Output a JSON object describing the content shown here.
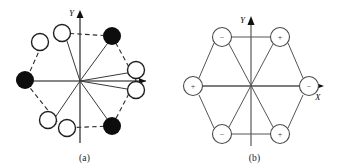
{
  "figure": {
    "panels": [
      {
        "id": "a",
        "caption": "(a)",
        "axis": {
          "x_label": "X",
          "y_label": "Y"
        },
        "description": "hexagonal arrangement with filled and open circles, dashed hexagon outline and solid star diagonals",
        "nodes": [
          {
            "name": "node-top-right",
            "fill": "filled",
            "x": 112,
            "y": 36
          },
          {
            "name": "node-right-upper",
            "fill": "open",
            "x": 136,
            "y": 70
          },
          {
            "name": "node-right-lower",
            "fill": "open",
            "x": 136,
            "y": 90
          },
          {
            "name": "node-bottom-right",
            "fill": "filled",
            "x": 112,
            "y": 126
          },
          {
            "name": "node-bottom-left-inner",
            "fill": "open",
            "x": 67,
            "y": 128
          },
          {
            "name": "node-bottom-left-outer",
            "fill": "open",
            "x": 48,
            "y": 120
          },
          {
            "name": "node-left",
            "fill": "filled",
            "x": 25,
            "y": 80
          },
          {
            "name": "node-top-left-outer",
            "fill": "open",
            "x": 40,
            "y": 42
          },
          {
            "name": "node-top-left-inner",
            "fill": "open",
            "x": 62,
            "y": 33
          }
        ]
      },
      {
        "id": "b",
        "caption": "(b)",
        "axis": {
          "x_label": "X",
          "y_label": "Y"
        },
        "description": "regular hexagon of six open circles labelled with alternating plus and minus signs, solid edges and solid diagonals",
        "nodes": [
          {
            "name": "node-top-left",
            "sign": "−",
            "x": 52,
            "y": 37
          },
          {
            "name": "node-top-right",
            "sign": "+",
            "x": 110,
            "y": 37
          },
          {
            "name": "node-left",
            "sign": "+",
            "x": 23,
            "y": 86
          },
          {
            "name": "node-right",
            "sign": "−",
            "x": 139,
            "y": 86
          },
          {
            "name": "node-bottom-left",
            "sign": "−",
            "x": 52,
            "y": 134
          },
          {
            "name": "node-bottom-right",
            "sign": "+",
            "x": 110,
            "y": 134
          }
        ]
      }
    ],
    "colors": {
      "ink": "#111111",
      "filled_node": "#0d0d0d",
      "open_node_stroke": "#2b2b2b",
      "line": "#3a3a3a",
      "background": "#ffffff"
    }
  }
}
